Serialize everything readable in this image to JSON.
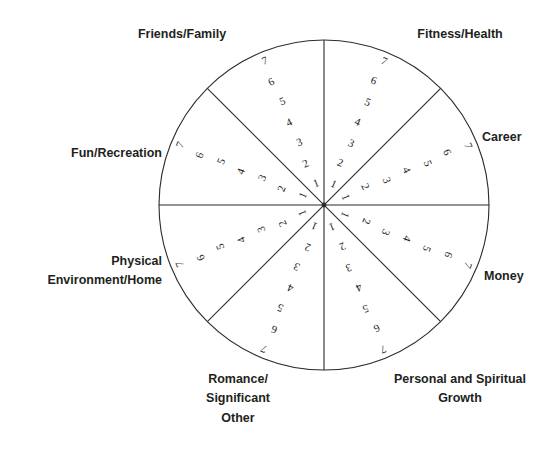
{
  "diagram": {
    "type": "wheel-of-life",
    "geometry": {
      "center_x": 324,
      "center_y": 205,
      "radius": 165,
      "segment_count": 8,
      "scale_min": 1,
      "scale_max": 7
    },
    "colors": {
      "background": "#ffffff",
      "stroke": "#2b2b2b",
      "label_text": "#231f20",
      "number_text": "#1c1c1c"
    },
    "scale_values": [
      "1",
      "2",
      "3",
      "4",
      "5",
      "6",
      "7"
    ],
    "segments": [
      {
        "id": "fitness-health",
        "label": "Fitness/Health",
        "start_angle": -90,
        "end_angle": -45,
        "bisector_angle": -67.5,
        "label_align": "center",
        "label_left": 390,
        "label_top": 25,
        "label_width": 140
      },
      {
        "id": "career",
        "label": "Career",
        "start_angle": -45,
        "end_angle": 0,
        "bisector_angle": -22.5,
        "label_align": "left",
        "label_left": 482,
        "label_top": 128,
        "label_width": 78
      },
      {
        "id": "money",
        "label": "Money",
        "start_angle": 0,
        "end_angle": 45,
        "bisector_angle": 22.5,
        "label_align": "left",
        "label_left": 484,
        "label_top": 267,
        "label_width": 76
      },
      {
        "id": "personal-and-spiritual-growth",
        "label": "Personal and Spiritual\nGrowth",
        "start_angle": 45,
        "end_angle": 90,
        "bisector_angle": 67.5,
        "label_align": "center",
        "label_left": 370,
        "label_top": 370,
        "label_width": 180
      },
      {
        "id": "romance-significant-other",
        "label": "Romance/\nSignificant\nOther",
        "start_angle": 90,
        "end_angle": 135,
        "bisector_angle": 112.5,
        "label_align": "center",
        "label_left": 178,
        "label_top": 370,
        "label_width": 120
      },
      {
        "id": "physical-environment-home",
        "label": "Physical\nEnvironment/Home",
        "start_angle": 135,
        "end_angle": 180,
        "bisector_angle": 157.5,
        "label_align": "right",
        "label_left": 14,
        "label_top": 252,
        "label_width": 148
      },
      {
        "id": "fun-recreation",
        "label": "Fun/Recreation",
        "start_angle": 180,
        "end_angle": 225,
        "bisector_angle": 202.5,
        "label_align": "right",
        "label_left": 20,
        "label_top": 144,
        "label_width": 142
      },
      {
        "id": "friends-family",
        "label": "Friends/Family",
        "start_angle": 225,
        "end_angle": 270,
        "bisector_angle": 247.5,
        "label_align": "center",
        "label_left": 112,
        "label_top": 25,
        "label_width": 140
      }
    ]
  }
}
